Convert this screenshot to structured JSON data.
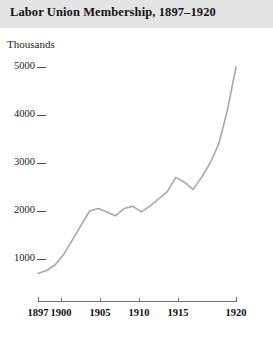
{
  "figure": {
    "width": 273,
    "height": 337,
    "background": "#ffffff",
    "header_band_color": "#e4e4e4",
    "title": "Labor Union Membership, 1897–1920"
  },
  "chart_data": {
    "type": "line",
    "title": "Labor Union Membership, 1897–1920",
    "subtitle": "",
    "xlabel": "",
    "ylabel": "Thousands",
    "unit_label": "Thousands",
    "grid": false,
    "legend": false,
    "legend_position": "none",
    "line_color": "#a8a8a8",
    "line_width": 1.6,
    "xlim": [
      1897,
      1920
    ],
    "ylim": [
      0,
      5200
    ],
    "xticks": [
      1897,
      1900,
      1905,
      1910,
      1915,
      1920
    ],
    "xtick_labels": [
      "1897",
      "1900",
      "1905",
      "1910",
      "1915",
      "1920"
    ],
    "yticks": [
      1000,
      2000,
      3000,
      4000,
      5000
    ],
    "ytick_labels": [
      "1000",
      "2000",
      "3000",
      "4000",
      "5000"
    ],
    "series": [
      {
        "name": "Labor union membership",
        "x": [
          1897,
          1898,
          1899,
          1900,
          1901,
          1902,
          1903,
          1904,
          1905,
          1906,
          1907,
          1908,
          1909,
          1910,
          1911,
          1912,
          1913,
          1914,
          1915,
          1916,
          1917,
          1918,
          1919,
          1920
        ],
        "values": [
          700,
          760,
          880,
          1100,
          1400,
          1700,
          2000,
          2050,
          1980,
          1900,
          2050,
          2100,
          1980,
          2100,
          2250,
          2400,
          2700,
          2600,
          2450,
          2700,
          3000,
          3400,
          4100,
          5000
        ]
      }
    ]
  },
  "axes_geometry": {
    "plot_left": 38,
    "plot_right": 250,
    "plot_top": 60,
    "plot_bottom": 300,
    "x_pixels": {
      "1897": 38,
      "1900": 61,
      "1905": 100,
      "1910": 139,
      "1915": 178,
      "1920": 236
    },
    "y_pixels": {
      "1000": 259,
      "2000": 211,
      "3000": 163,
      "4000": 115,
      "5000": 67
    },
    "axis_line_color": "#6f6f6f",
    "tick_color": "#4a4a4a"
  }
}
